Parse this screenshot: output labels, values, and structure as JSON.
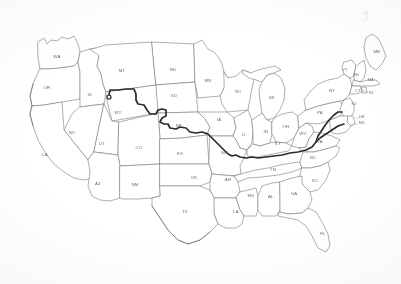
{
  "document": {
    "type": "map",
    "title": "United States State Map",
    "description": "Scanned outline map of the contiguous United States with state abbreviation labels and a heavy dark route line.",
    "background_color": "#ffffff",
    "border_color": "#6e6e70",
    "label_color": "#6a6a6c",
    "route_color": "#2b2b2e"
  },
  "map": {
    "region": "Contiguous United States",
    "projection_hint": "albers-like",
    "state_count": 48,
    "states": [
      {
        "abbr": "WA",
        "name": "Washington",
        "label_x": 57,
        "label_y": 57
      },
      {
        "abbr": "OR",
        "name": "Oregon",
        "label_x": 47,
        "label_y": 88
      },
      {
        "abbr": "ID",
        "name": "Idaho",
        "label_x": 90,
        "label_y": 95
      },
      {
        "abbr": "MT",
        "name": "Montana",
        "label_x": 122,
        "label_y": 71
      },
      {
        "abbr": "ND",
        "name": "North Dakota",
        "label_x": 173,
        "label_y": 70
      },
      {
        "abbr": "SD",
        "name": "South Dakota",
        "label_x": 174,
        "label_y": 96
      },
      {
        "abbr": "MN",
        "name": "Minnesota",
        "label_x": 208,
        "label_y": 81
      },
      {
        "abbr": "WI",
        "name": "Wisconsin",
        "label_x": 238,
        "label_y": 92
      },
      {
        "abbr": "MI",
        "name": "Michigan",
        "label_x": 272,
        "label_y": 98
      },
      {
        "abbr": "WY",
        "name": "Wyoming",
        "label_x": 118,
        "label_y": 113
      },
      {
        "abbr": "NE",
        "name": "Nebraska",
        "label_x": 179,
        "label_y": 126
      },
      {
        "abbr": "IA",
        "name": "Iowa",
        "label_x": 219,
        "label_y": 120
      },
      {
        "abbr": "IL",
        "name": "Illinois",
        "label_x": 244,
        "label_y": 135
      },
      {
        "abbr": "IN",
        "name": "Indiana",
        "label_x": 266,
        "label_y": 132
      },
      {
        "abbr": "OH",
        "name": "Ohio",
        "label_x": 286,
        "label_y": 127
      },
      {
        "abbr": "NV",
        "name": "Nevada",
        "label_x": 72,
        "label_y": 133
      },
      {
        "abbr": "UT",
        "name": "Utah",
        "label_x": 102,
        "label_y": 144
      },
      {
        "abbr": "CO",
        "name": "Colorado",
        "label_x": 139,
        "label_y": 148
      },
      {
        "abbr": "KS",
        "name": "Kansas",
        "label_x": 180,
        "label_y": 154
      },
      {
        "abbr": "MO",
        "name": "Missouri",
        "label_x": 225,
        "label_y": 153
      },
      {
        "abbr": "KY",
        "name": "Kentucky",
        "label_x": 278,
        "label_y": 144
      },
      {
        "abbr": "WV",
        "name": "West Virginia",
        "label_x": 303,
        "label_y": 134
      },
      {
        "abbr": "VA",
        "name": "Virginia",
        "label_x": 320,
        "label_y": 142
      },
      {
        "abbr": "CA",
        "name": "California",
        "label_x": 45,
        "label_y": 155
      },
      {
        "abbr": "AZ",
        "name": "Arizona",
        "label_x": 98,
        "label_y": 184
      },
      {
        "abbr": "NM",
        "name": "New Mexico",
        "label_x": 135,
        "label_y": 185
      },
      {
        "abbr": "OK",
        "name": "Oklahoma",
        "label_x": 194,
        "label_y": 178
      },
      {
        "abbr": "AR",
        "name": "Arkansas",
        "label_x": 228,
        "label_y": 180
      },
      {
        "abbr": "TN",
        "name": "Tennessee",
        "label_x": 273,
        "label_y": 170
      },
      {
        "abbr": "NC",
        "name": "North Carolina",
        "label_x": 313,
        "label_y": 158
      },
      {
        "abbr": "SC",
        "name": "South Carolina",
        "label_x": 315,
        "label_y": 181
      },
      {
        "abbr": "MS",
        "name": "Mississippi",
        "label_x": 251,
        "label_y": 196
      },
      {
        "abbr": "AL",
        "name": "Alabama",
        "label_x": 271,
        "label_y": 197
      },
      {
        "abbr": "GA",
        "name": "Georgia",
        "label_x": 294,
        "label_y": 194
      },
      {
        "abbr": "LA",
        "name": "Louisiana",
        "label_x": 236,
        "label_y": 212
      },
      {
        "abbr": "TX",
        "name": "Texas",
        "label_x": 185,
        "label_y": 212
      },
      {
        "abbr": "FL",
        "name": "Florida",
        "label_x": 323,
        "label_y": 234
      },
      {
        "abbr": "PA",
        "name": "Pennsylvania",
        "label_x": 320,
        "label_y": 113
      },
      {
        "abbr": "NY",
        "name": "New York",
        "label_x": 332,
        "label_y": 91
      },
      {
        "abbr": "ME",
        "name": "Maine",
        "label_x": 377,
        "label_y": 52
      },
      {
        "abbr": "VT",
        "name": "Vermont",
        "label_x": 345,
        "label_y": 70
      },
      {
        "abbr": "NH",
        "name": "New Hampshire",
        "label_x": 356,
        "label_y": 75
      },
      {
        "abbr": "MA",
        "name": "Massachusetts",
        "label_x": 371,
        "label_y": 80
      },
      {
        "abbr": "CT",
        "name": "Connecticut",
        "label_x": 358,
        "label_y": 91
      },
      {
        "abbr": "RI",
        "name": "Rhode Island",
        "label_x": 371,
        "label_y": 93
      },
      {
        "abbr": "NJ",
        "name": "New Jersey",
        "label_x": 354,
        "label_y": 104
      },
      {
        "abbr": "DE",
        "name": "Delaware",
        "label_x": 362,
        "label_y": 117
      },
      {
        "abbr": "MD",
        "name": "Maryland",
        "label_x": 362,
        "label_y": 123
      }
    ],
    "route": {
      "name": "highlighted-route",
      "description": "Heavy dark line running from Montana southeast through Wyoming, Nebraska and Missouri, then east along the Ohio River to the mid-Atlantic coast.",
      "color": "#2b2b2e",
      "stroke_width": 1.7
    }
  }
}
